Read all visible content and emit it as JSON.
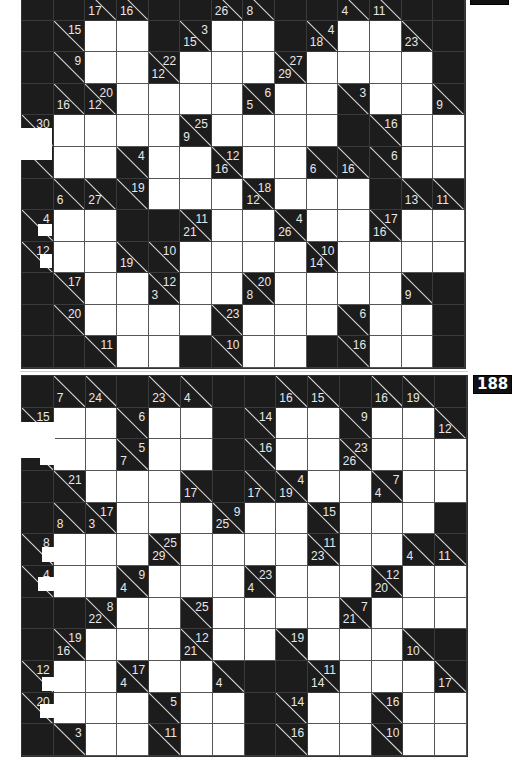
{
  "page": {
    "background": "#ffffff",
    "cell_black": "#1c1c1c",
    "cell_white": "#ffffff",
    "clue_text_color": "#e8e8e8"
  },
  "puzzles": [
    {
      "number": "187",
      "rows": 12,
      "cols": 14,
      "grid": [
        [
          "B",
          "B",
          {
            "d": 17
          },
          {
            "d": 16
          },
          "B",
          "B",
          {
            "d": 26
          },
          {
            "d": 8
          },
          "B",
          "B",
          {
            "d": 4
          },
          {
            "d": 11
          },
          "B",
          "B"
        ],
        [
          "B",
          {
            "a": 15
          },
          "W",
          "W",
          "B",
          {
            "d": 15,
            "a": 3
          },
          "W",
          "W",
          "B",
          {
            "d": 18,
            "a": 4
          },
          "W",
          "W",
          {
            "d": 23
          },
          "B"
        ],
        [
          "B",
          {
            "a": 9
          },
          "W",
          "W",
          {
            "d": 12,
            "a": 22
          },
          "W",
          "W",
          "W",
          {
            "d": 29,
            "a": 27
          },
          "W",
          "W",
          "W",
          "W",
          "B"
        ],
        [
          "B",
          {
            "d": 16
          },
          {
            "d": 12,
            "a": 20
          },
          "W",
          "W",
          "W",
          "W",
          {
            "d": 5,
            "a": 6
          },
          "W",
          "W",
          {
            "a": 3
          },
          "W",
          "W",
          {
            "d": 9
          }
        ],
        [
          {
            "a": 30
          },
          "W",
          "W",
          "W",
          "W",
          {
            "d": 9,
            "a": 25
          },
          "W",
          "W",
          "W",
          "W",
          "B",
          {
            "a": 16
          },
          "W",
          "W"
        ],
        [
          {},
          "W",
          "W",
          {
            "a": 4
          },
          "W",
          "W",
          {
            "d": 16,
            "a": 12
          },
          "W",
          "W",
          {
            "d": 6
          },
          {
            "d": 16
          },
          {
            "a": 6
          },
          "W",
          "W"
        ],
        [
          "B",
          {
            "d": 6
          },
          {
            "d": 27
          },
          {
            "a": 19
          },
          "W",
          "W",
          "W",
          {
            "d": 12,
            "a": 18
          },
          "W",
          "W",
          "W",
          "B",
          {
            "d": 13
          },
          {
            "d": 11
          }
        ],
        [
          {
            "a": 4
          },
          "W",
          "W",
          "B",
          "B",
          {
            "d": 21,
            "a": 11
          },
          "W",
          "W",
          {
            "d": 26,
            "a": 4
          },
          "W",
          "W",
          {
            "d": 16,
            "a": 17
          },
          "W",
          "W"
        ],
        [
          {
            "a": 12
          },
          "W",
          "W",
          {
            "d": 19
          },
          {
            "a": 10
          },
          "W",
          "W",
          "W",
          "W",
          {
            "d": 14,
            "a": 10
          },
          "W",
          "W",
          "W",
          "W"
        ],
        [
          "B",
          {
            "a": 17
          },
          "W",
          "W",
          {
            "d": 3,
            "a": 12
          },
          "W",
          "W",
          {
            "d": 8,
            "a": 20
          },
          "W",
          "W",
          "W",
          "W",
          {
            "d": 9
          },
          "B"
        ],
        [
          "B",
          {
            "a": 20
          },
          "W",
          "W",
          "W",
          "W",
          {
            "a": 23
          },
          "W",
          "W",
          "W",
          {
            "a": 6
          },
          "W",
          "W",
          "B"
        ],
        [
          "B",
          "B",
          {
            "a": 11
          },
          "W",
          "W",
          "B",
          {
            "a": 10
          },
          "W",
          "W",
          "B",
          {
            "a": 16
          },
          "W",
          "W",
          "B"
        ]
      ]
    },
    {
      "number": "188",
      "rows": 12,
      "cols": 14,
      "grid": [
        [
          "B",
          {
            "d": 7
          },
          {
            "d": 24
          },
          "B",
          {
            "d": 23
          },
          {
            "d": 4
          },
          "B",
          "B",
          {
            "d": 16
          },
          {
            "d": 15
          },
          "B",
          {
            "d": 16
          },
          {
            "d": 19
          },
          "B"
        ],
        [
          {
            "a": 15
          },
          "W",
          "W",
          {
            "a": 6
          },
          "W",
          "W",
          "B",
          {
            "a": 14
          },
          "W",
          "W",
          {
            "a": 9
          },
          "W",
          "W",
          {
            "d": 12
          }
        ],
        [
          {},
          "W",
          "W",
          {
            "d": 7,
            "a": 5
          },
          "W",
          "W",
          "B",
          {
            "a": 16
          },
          "W",
          "W",
          {
            "d": 26,
            "a": 23
          },
          "W",
          "W",
          "W"
        ],
        [
          "B",
          {
            "a": 21
          },
          "W",
          "W",
          "W",
          {
            "d": 17
          },
          "B",
          {
            "d": 17
          },
          {
            "d": 19,
            "a": 4
          },
          "W",
          "W",
          {
            "d": 4,
            "a": 7
          },
          "W",
          "W"
        ],
        [
          "B",
          {
            "d": 8
          },
          {
            "d": 3,
            "a": 17
          },
          "W",
          "W",
          "W",
          {
            "d": 25,
            "a": 9
          },
          "W",
          "W",
          {
            "a": 15
          },
          "W",
          "W",
          "W",
          "B"
        ],
        [
          {
            "a": 8
          },
          "W",
          "W",
          "W",
          {
            "d": 29,
            "a": 25
          },
          "W",
          "W",
          "W",
          "W",
          {
            "d": 23,
            "a": 11
          },
          "W",
          "W",
          {
            "d": 4
          },
          {
            "d": 11
          }
        ],
        [
          {
            "a": 4
          },
          "W",
          "W",
          {
            "d": 4,
            "a": 9
          },
          "W",
          "W",
          "W",
          {
            "d": 4,
            "a": 23
          },
          "W",
          "W",
          "W",
          {
            "d": 20,
            "a": 12
          },
          "W",
          "W"
        ],
        [
          "B",
          "B",
          {
            "d": 22,
            "a": 8
          },
          "W",
          "W",
          {
            "a": 25
          },
          "W",
          "W",
          "W",
          "W",
          {
            "d": 21,
            "a": 7
          },
          "W",
          "W",
          "W"
        ],
        [
          "B",
          {
            "d": 16,
            "a": 19
          },
          "W",
          "W",
          "W",
          {
            "d": 21,
            "a": 12
          },
          "W",
          "W",
          {
            "a": 19
          },
          "W",
          "W",
          "W",
          {
            "d": 10
          },
          "B"
        ],
        [
          {
            "a": 12
          },
          "W",
          "W",
          {
            "d": 4,
            "a": 17
          },
          "W",
          "W",
          {
            "d": 4
          },
          "B",
          "B",
          {
            "d": 14,
            "a": 11
          },
          "W",
          "W",
          "W",
          {
            "d": 17
          }
        ],
        [
          {
            "a": 20
          },
          "W",
          "W",
          "W",
          {
            "a": 5
          },
          "W",
          "W",
          "B",
          {
            "a": 14
          },
          "W",
          "W",
          {
            "a": 16
          },
          "W",
          "W"
        ],
        [
          "B",
          {
            "a": 3
          },
          "W",
          "W",
          {
            "a": 11
          },
          "W",
          "W",
          "B",
          {
            "a": 16
          },
          "W",
          "W",
          {
            "a": 10
          },
          "W",
          "W"
        ]
      ]
    }
  ]
}
